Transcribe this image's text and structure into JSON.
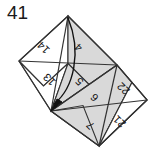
{
  "figure": {
    "problem_number": "41",
    "colors": {
      "stroke": "#333333",
      "shaded_fill": "#d9d9d9",
      "plain_fill": "#ffffff",
      "label_color": "#111111",
      "background": "#ffffff",
      "arrow_color": "#111111"
    },
    "geometry": {
      "top_vertex": [
        68,
        16
      ],
      "left_vertex": [
        19,
        61
      ],
      "mid_upper_vertex": [
        117,
        65
      ],
      "center_vertex": [
        51,
        111
      ],
      "right_vertex": [
        147,
        100
      ],
      "bottom_vertex": [
        99,
        146
      ]
    },
    "arrow": {
      "name": "fold-arrow",
      "from": [
        68,
        16
      ],
      "to": [
        51,
        111
      ],
      "style": "curved-with-arrowhead"
    },
    "cells": [
      {
        "id": "cell-14",
        "label": "14",
        "x": 44,
        "y": 47,
        "rotation": 225,
        "shaded": false
      },
      {
        "id": "cell-4",
        "label": "4",
        "x": 79,
        "y": 47,
        "rotation": 225,
        "shaded": true
      },
      {
        "id": "cell-13",
        "label": "13",
        "x": 50,
        "y": 79,
        "rotation": 225,
        "shaded": false
      },
      {
        "id": "cell-5",
        "label": "5",
        "x": 80,
        "y": 81,
        "rotation": 225,
        "shaded": true
      },
      {
        "id": "cell-6",
        "label": "6",
        "x": 95,
        "y": 97,
        "rotation": 225,
        "shaded": true
      },
      {
        "id": "cell-22",
        "label": "22",
        "x": 124,
        "y": 88,
        "rotation": 225,
        "shaded": false
      },
      {
        "id": "cell-7",
        "label": "7",
        "x": 91,
        "y": 125,
        "rotation": 225,
        "shaded": true
      },
      {
        "id": "cell-21",
        "label": "21",
        "x": 120,
        "y": 121,
        "rotation": 225,
        "shaded": false
      }
    ]
  }
}
